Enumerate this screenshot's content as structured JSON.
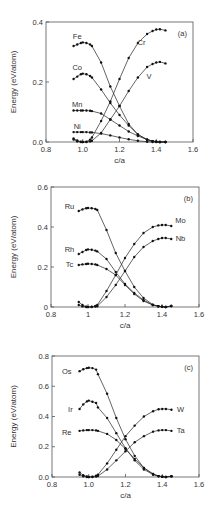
{
  "chart_data": [
    {
      "type": "line",
      "panel_label": "(a)",
      "xlabel": "c/a",
      "ylabel": "Energy (eV/atom)",
      "xlim": [
        0.8,
        1.6
      ],
      "ylim": [
        0.0,
        0.4
      ],
      "xticks": [
        "0.8",
        "1.0",
        "1.2",
        "1.4",
        "1.6"
      ],
      "yticks": [
        "0.0",
        "0.2",
        "0.4"
      ],
      "grid": false,
      "legend": "inline labels",
      "box": {
        "left": 46,
        "right": 193,
        "top": 22,
        "bottom": 142
      },
      "x": [
        0.95,
        0.97,
        0.99,
        1.0,
        1.02,
        1.04,
        1.05,
        1.1,
        1.15,
        1.2,
        1.25,
        1.3,
        1.35,
        1.38,
        1.4,
        1.42,
        1.45
      ],
      "series": [
        {
          "name": "Fe",
          "label_pos": [
            0.97,
            0.345
          ],
          "values": [
            0.32,
            0.325,
            0.33,
            0.332,
            0.33,
            0.325,
            0.32,
            0.265,
            0.185,
            0.12,
            0.06,
            0.025,
            0.008,
            0.003,
            0.001,
            0.0,
            0.0
          ]
        },
        {
          "name": "Co",
          "label_pos": [
            0.97,
            0.24
          ],
          "values": [
            0.21,
            0.218,
            0.226,
            0.228,
            0.226,
            0.22,
            0.215,
            0.175,
            0.13,
            0.09,
            0.055,
            0.025,
            0.008,
            0.003,
            0.001,
            0.0,
            0.0
          ]
        },
        {
          "name": "Mn",
          "label_pos": [
            0.97,
            0.118
          ],
          "values": [
            0.105,
            0.105,
            0.105,
            0.105,
            0.105,
            0.104,
            0.103,
            0.095,
            0.075,
            0.055,
            0.035,
            0.02,
            0.008,
            0.003,
            0.001,
            0.0,
            0.0
          ]
        },
        {
          "name": "Ni",
          "label_pos": [
            0.97,
            0.045
          ],
          "values": [
            0.033,
            0.033,
            0.033,
            0.033,
            0.033,
            0.032,
            0.032,
            0.028,
            0.022,
            0.015,
            0.009,
            0.004,
            0.001,
            0.0,
            0.0,
            0.0,
            0.0
          ]
        },
        {
          "name": "Cr",
          "label_pos": [
            1.32,
            0.325
          ],
          "values": [
            0.012,
            0.005,
            0.001,
            0.0,
            0.001,
            0.008,
            0.015,
            0.07,
            0.135,
            0.21,
            0.28,
            0.33,
            0.36,
            0.37,
            0.375,
            0.376,
            0.372
          ]
        },
        {
          "name": "V",
          "label_pos": [
            1.36,
            0.21
          ],
          "values": [
            0.008,
            0.002,
            0.0,
            0.0,
            0.0,
            0.002,
            0.004,
            0.03,
            0.075,
            0.12,
            0.17,
            0.215,
            0.25,
            0.26,
            0.265,
            0.267,
            0.262
          ]
        }
      ]
    },
    {
      "type": "line",
      "panel_label": "(b)",
      "xlabel": "c/a",
      "ylabel": "Energy (eV/atom)",
      "xlim": [
        0.8,
        1.6
      ],
      "ylim": [
        0.0,
        0.6
      ],
      "xticks": [
        "0.8",
        "1",
        "1.2",
        "1.4",
        "1.6"
      ],
      "yticks": [
        "0",
        "0.2",
        "0.4",
        "0.6"
      ],
      "grid": false,
      "legend": "inline labels",
      "box": {
        "left": 51,
        "right": 199,
        "top": 187,
        "bottom": 307
      },
      "x": [
        0.95,
        0.97,
        0.99,
        1.0,
        1.02,
        1.04,
        1.05,
        1.1,
        1.15,
        1.2,
        1.25,
        1.3,
        1.35,
        1.38,
        1.4,
        1.42,
        1.45
      ],
      "series": [
        {
          "name": "Ru",
          "label_pos": [
            0.9,
            0.49
          ],
          "values": [
            0.48,
            0.488,
            0.494,
            0.495,
            0.494,
            0.49,
            0.485,
            0.385,
            0.27,
            0.18,
            0.1,
            0.045,
            0.012,
            0.004,
            0.001,
            0.0,
            0.005
          ]
        },
        {
          "name": "Rh",
          "label_pos": [
            0.9,
            0.275
          ],
          "values": [
            0.265,
            0.275,
            0.285,
            0.288,
            0.286,
            0.282,
            0.278,
            0.24,
            0.175,
            0.115,
            0.07,
            0.035,
            0.01,
            0.004,
            0.001,
            0.0,
            0.005
          ]
        },
        {
          "name": "Tc",
          "label_pos": [
            0.9,
            0.2
          ],
          "values": [
            0.21,
            0.213,
            0.215,
            0.216,
            0.215,
            0.213,
            0.21,
            0.19,
            0.16,
            0.11,
            0.065,
            0.03,
            0.01,
            0.004,
            0.001,
            0.0,
            0.005
          ]
        },
        {
          "name": "Mo",
          "label_pos": [
            1.5,
            0.42
          ],
          "values": [
            0.025,
            0.01,
            0.002,
            0.0,
            0.001,
            0.005,
            0.01,
            0.08,
            0.16,
            0.245,
            0.315,
            0.37,
            0.4,
            0.408,
            0.41,
            0.41,
            0.405
          ]
        },
        {
          "name": "Nb",
          "label_pos": [
            1.5,
            0.33
          ],
          "values": [
            0.01,
            0.003,
            0.0,
            0.0,
            0.0,
            0.002,
            0.004,
            0.05,
            0.11,
            0.18,
            0.25,
            0.3,
            0.33,
            0.34,
            0.345,
            0.345,
            0.34
          ]
        }
      ]
    },
    {
      "type": "line",
      "panel_label": "(c)",
      "xlabel": "c/a",
      "ylabel": "Energy (eV/atom)",
      "xlim": [
        0.8,
        1.6
      ],
      "ylim": [
        0.0,
        0.8
      ],
      "xticks": [
        "0.8",
        "1.0",
        "1.2",
        "1.4",
        "1.6"
      ],
      "yticks": [
        "0.0",
        "0.2",
        "0.4",
        "0.6",
        "0.8"
      ],
      "grid": false,
      "legend": "inline labels",
      "box": {
        "left": 52,
        "right": 199,
        "top": 356,
        "bottom": 477
      },
      "x": [
        0.95,
        0.97,
        0.99,
        1.0,
        1.02,
        1.04,
        1.05,
        1.1,
        1.15,
        1.2,
        1.25,
        1.3,
        1.35,
        1.38,
        1.4,
        1.42,
        1.45
      ],
      "series": [
        {
          "name": "Os",
          "label_pos": [
            0.88,
            0.68
          ],
          "values": [
            0.7,
            0.712,
            0.72,
            0.722,
            0.72,
            0.71,
            0.68,
            0.55,
            0.39,
            0.25,
            0.14,
            0.06,
            0.02,
            0.006,
            0.002,
            0.0,
            0.005
          ]
        },
        {
          "name": "Ir",
          "label_pos": [
            0.9,
            0.43
          ],
          "values": [
            0.45,
            0.48,
            0.5,
            0.505,
            0.498,
            0.49,
            0.46,
            0.39,
            0.29,
            0.19,
            0.11,
            0.05,
            0.015,
            0.005,
            0.002,
            0.0,
            0.005
          ]
        },
        {
          "name": "Re",
          "label_pos": [
            0.88,
            0.28
          ],
          "values": [
            0.305,
            0.308,
            0.31,
            0.31,
            0.31,
            0.308,
            0.305,
            0.285,
            0.245,
            0.185,
            0.12,
            0.06,
            0.02,
            0.006,
            0.002,
            0.0,
            0.005
          ]
        },
        {
          "name": "W",
          "label_pos": [
            1.5,
            0.43
          ],
          "values": [
            0.03,
            0.012,
            0.003,
            0.0,
            0.002,
            0.008,
            0.015,
            0.09,
            0.18,
            0.27,
            0.34,
            0.4,
            0.435,
            0.448,
            0.45,
            0.45,
            0.445
          ]
        },
        {
          "name": "Ta",
          "label_pos": [
            1.5,
            0.29
          ],
          "values": [
            0.015,
            0.005,
            0.0,
            0.0,
            0.0,
            0.003,
            0.006,
            0.05,
            0.11,
            0.17,
            0.23,
            0.27,
            0.3,
            0.308,
            0.31,
            0.31,
            0.305
          ]
        }
      ]
    }
  ]
}
